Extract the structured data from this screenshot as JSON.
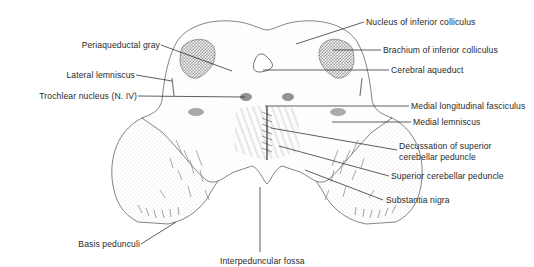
{
  "figure": {
    "colors": {
      "ink": "#1a1a1a",
      "label_text": "#2a2a2a",
      "stipple": "#555555",
      "background": "#ffffff"
    }
  },
  "labels": {
    "periaqueductal_gray": "Periaqueductal gray",
    "lateral_lemniscus": "Lateral lemniscus",
    "trochlear_nucleus": "Trochlear nucleus (N. IV)",
    "basis_pedunculi": "Basis pedunculi",
    "interpeduncular_fossa": "Interpeduncular fossa",
    "nucleus_inferior_colliculus": "Nucleus of inferior colliculus",
    "brachium_inferior_colliculus": "Brachium of inferior colliculus",
    "cerebral_aqueduct": "Cerebral aqueduct",
    "medial_longitudinal_fasciculus": "Medial longitudinal fasciculus",
    "medial_lemniscus": "Medial lemniscus",
    "decussation_scp": "Decussation of superior\ncerebellar peduncle",
    "superior_cerebellar_peduncle": "Superior cerebellar peduncle",
    "substantia_nigra": "Substantia nigra"
  }
}
